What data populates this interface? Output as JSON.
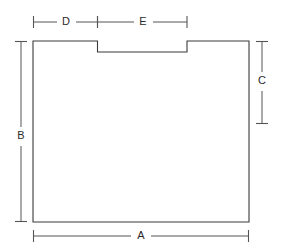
{
  "diagram": {
    "type": "engineering-dimension-drawing",
    "units": "unlabeled",
    "line_color": "#3a3a3a",
    "dimension_line_color": "#555555",
    "label_color": "#2b2b2b",
    "background_color": "#ffffff",
    "labels": {
      "a": "A",
      "b": "B",
      "c": "C",
      "d": "D",
      "e": "E"
    },
    "dimensions": [
      {
        "key": "a",
        "label": "A",
        "orientation": "horizontal",
        "position": "bottom",
        "measures": "overall width of panel",
        "pixel_span": 216,
        "from": 33,
        "to": 249,
        "axis_pos": 236
      },
      {
        "key": "b",
        "label": "B",
        "orientation": "vertical",
        "position": "left",
        "measures": "overall height of panel",
        "pixel_span": 181,
        "from": 41,
        "to": 222,
        "axis_pos": 21
      },
      {
        "key": "c",
        "label": "C",
        "orientation": "vertical",
        "position": "right",
        "measures": "height from top edge to intermediate point",
        "pixel_span": 83,
        "from": 41,
        "to": 124,
        "axis_pos": 262
      },
      {
        "key": "d",
        "label": "D",
        "orientation": "horizontal",
        "position": "top",
        "measures": "width from left edge to notch start",
        "pixel_span": 65,
        "from": 33,
        "to": 98,
        "axis_pos": 22
      },
      {
        "key": "e",
        "label": "E",
        "orientation": "horizontal",
        "position": "top",
        "measures": "width of notch",
        "pixel_span": 89,
        "from": 98,
        "to": 187,
        "axis_pos": 22
      }
    ],
    "shape": {
      "name": "notched-rectangle",
      "description": "Rectangle with a shallow rectangular notch cut into the top edge",
      "outline_path": "M 33 41 L 97.5 41 L 97.5 52 L 187 52 L 187 41 L 249 41 L 249 222 L 33 222 Z",
      "left": 33,
      "right": 249,
      "top": 41,
      "bottom": 222,
      "notch": {
        "left": 97.5,
        "right": 187,
        "top": 41,
        "depth_bottom": 52
      }
    },
    "label_positions": {
      "a": {
        "x": 141,
        "y": 236
      },
      "b": {
        "x": 21,
        "y": 136
      },
      "c": {
        "x": 262,
        "y": 81
      },
      "d": {
        "x": 66,
        "y": 22
      },
      "e": {
        "x": 143,
        "y": 22
      }
    },
    "label_gaps": {
      "a": {
        "start": 131,
        "end": 151
      },
      "b": {
        "start": 127,
        "end": 146
      },
      "c": {
        "start": 72,
        "end": 91
      },
      "d": {
        "start": 57,
        "end": 76
      },
      "e": {
        "start": 134,
        "end": 153
      }
    }
  }
}
